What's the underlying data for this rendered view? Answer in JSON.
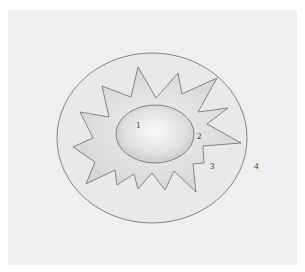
{
  "diagram": {
    "labels": {
      "inner_ellipse": "1",
      "inner_star_ring": "2",
      "star_edge": "3",
      "outer_region": "4"
    },
    "colors": {
      "background": "#ffffff",
      "panel": "#efefef",
      "outer_ellipse_fill": "#e9e9e9",
      "star_fill": "#dcdcdc",
      "inner_ellipse_center": "#fafafa",
      "inner_ellipse_edge": "#c4c4c4",
      "stroke": "#6a6a6a"
    }
  }
}
